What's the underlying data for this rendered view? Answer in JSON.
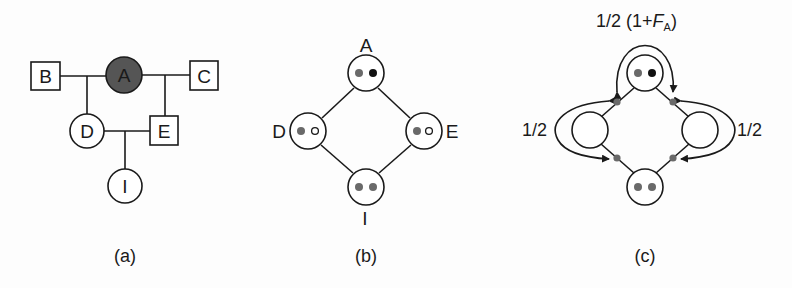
{
  "panels": {
    "a": {
      "caption": "(a)",
      "nodes": {
        "A": "A",
        "B": "B",
        "C": "C",
        "D": "D",
        "E": "E",
        "I": "I"
      }
    },
    "b": {
      "caption": "(b)",
      "nodes": {
        "A": "A",
        "D": "D",
        "E": "E",
        "I": "I"
      }
    },
    "c": {
      "caption": "(c)",
      "top_label_prefix": "1/2 (1+",
      "top_label_var": "F",
      "top_label_sub": "A",
      "top_label_suffix": ")",
      "left_label": "1/2",
      "right_label": "1/2"
    }
  },
  "colors": {
    "ink": "#1a1a1a",
    "affected_fill": "#555555",
    "allele_gray": "#6a6a6a",
    "allele_black": "#111111"
  }
}
